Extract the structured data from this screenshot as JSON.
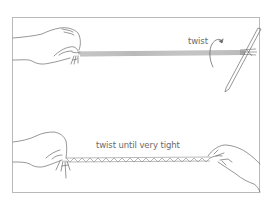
{
  "figure": {
    "type": "instructional-illustration",
    "panels": [
      {
        "id": "step-twist",
        "label": "twist",
        "description": "Left hand holds strands; pencil inserted at right end is rotated",
        "icon": "curved-rotation-arrow-icon"
      },
      {
        "id": "step-twist-tight",
        "label": "twist until very tight",
        "description": "Both hands hold the tightly twisted cord"
      }
    ],
    "colors": {
      "line": "#6a6a6a",
      "frame": "#b9b9b9",
      "cord": "#8a8a8a",
      "background": "#ffffff"
    }
  }
}
